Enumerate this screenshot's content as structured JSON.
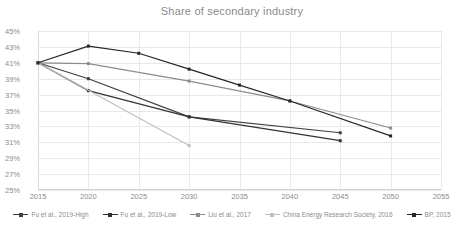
{
  "title": "Share of secondary industry",
  "axes": {
    "y_ticks": [
      "25%",
      "27%",
      "29%",
      "31%",
      "33%",
      "35%",
      "37%",
      "39%",
      "41%",
      "43%",
      "45%"
    ],
    "x_ticks": [
      "2015",
      "2020",
      "2025",
      "2030",
      "2035",
      "2040",
      "2045",
      "2050",
      "2055"
    ]
  },
  "legend": [
    {
      "label": "Fu et al., 2019-High",
      "color": "#404040"
    },
    {
      "label": "Fu et al., 2019-Low",
      "color": "#333333"
    },
    {
      "label": "Liu et al., 2017",
      "color": "#8c8c8c"
    },
    {
      "label": "China Energy Research Society, 2016",
      "color": "#bfbfbf"
    },
    {
      "label": "BP, 2015",
      "color": "#262626"
    }
  ],
  "chart_data": {
    "type": "line",
    "title": "Share of secondary industry",
    "xlabel": "",
    "ylabel": "",
    "xlim": [
      2015,
      2055
    ],
    "ylim": [
      25,
      45
    ],
    "ytick_values": [
      25,
      27,
      29,
      31,
      33,
      35,
      37,
      39,
      41,
      43,
      45
    ],
    "xtick_values": [
      2015,
      2020,
      2025,
      2030,
      2035,
      2040,
      2045,
      2050,
      2055
    ],
    "grid": "horizontal-and-vertical",
    "legend_position": "bottom",
    "y_unit": "percent",
    "series": [
      {
        "name": "Fu et al., 2019-High",
        "color": "#404040",
        "x": [
          2015,
          2020,
          2030,
          2045
        ],
        "values": [
          41.0,
          39.0,
          34.2,
          32.2
        ]
      },
      {
        "name": "Fu et al., 2019-Low",
        "color": "#333333",
        "x": [
          2015,
          2020,
          2030,
          2045
        ],
        "values": [
          41.0,
          37.5,
          34.2,
          31.2
        ]
      },
      {
        "name": "Liu et al., 2017",
        "color": "#8c8c8c",
        "x": [
          2015,
          2020,
          2030,
          2040,
          2050
        ],
        "values": [
          41.0,
          40.9,
          38.7,
          36.2,
          32.8
        ]
      },
      {
        "name": "China Energy Research Society, 2016",
        "color": "#bfbfbf",
        "x": [
          2015,
          2030
        ],
        "values": [
          41.0,
          30.6
        ]
      },
      {
        "name": "BP, 2015",
        "color": "#262626",
        "x": [
          2015,
          2020,
          2025,
          2030,
          2035,
          2040,
          2050
        ],
        "values": [
          41.0,
          43.1,
          42.2,
          40.2,
          38.2,
          36.2,
          31.8
        ]
      }
    ]
  }
}
